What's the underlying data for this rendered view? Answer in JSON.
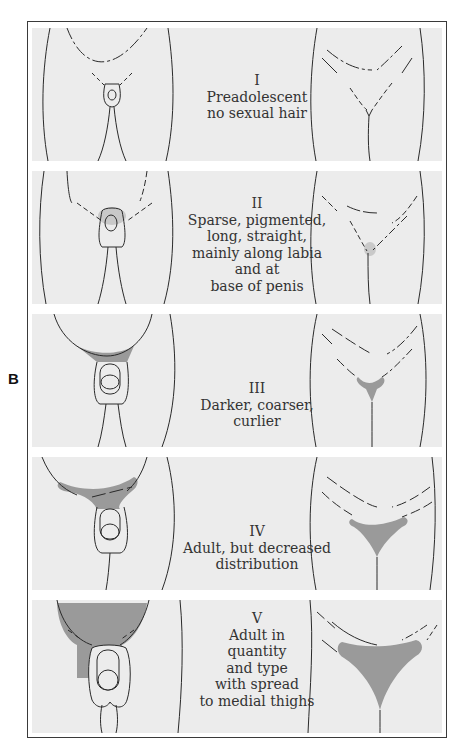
{
  "figure": {
    "side_label": "B",
    "hair_color": "#9a9a9a",
    "panel_bg": "#ececec",
    "line_color": "#2a2a2a"
  },
  "stages": [
    {
      "roman": "I",
      "lines": [
        "Preadolescent",
        "no sexual hair"
      ]
    },
    {
      "roman": "II",
      "lines": [
        "Sparse, pigmented,",
        "long, straight,",
        "mainly along labia",
        "and at",
        "base of penis"
      ]
    },
    {
      "roman": "III",
      "lines": [
        "Darker, coarser,",
        "curlier"
      ]
    },
    {
      "roman": "IV",
      "lines": [
        "Adult, but decreased",
        "distribution"
      ]
    },
    {
      "roman": "V",
      "lines": [
        "Adult in",
        "quantity",
        "and type",
        "with spread",
        "to medial thighs"
      ]
    }
  ]
}
